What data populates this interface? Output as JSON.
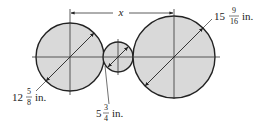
{
  "diagram": {
    "type": "three tangent circles with diameters and center distance",
    "colors": {
      "circle_fill": "#d9d9d9",
      "stroke": "#222222",
      "centerline": "#333333"
    },
    "distance_label": "x",
    "circles": [
      {
        "id": "left",
        "diameter_whole": "12",
        "diameter_num": "5",
        "diameter_den": "8",
        "unit": "in.",
        "diameter_text": "12 5/8 in."
      },
      {
        "id": "middle",
        "diameter_whole": "5",
        "diameter_num": "3",
        "diameter_den": "4",
        "unit": "in.",
        "diameter_text": "5 3/4 in."
      },
      {
        "id": "right",
        "diameter_whole": "15",
        "diameter_num": "9",
        "diameter_den": "16",
        "unit": "in.",
        "diameter_text": "15 9/16 in."
      }
    ]
  }
}
